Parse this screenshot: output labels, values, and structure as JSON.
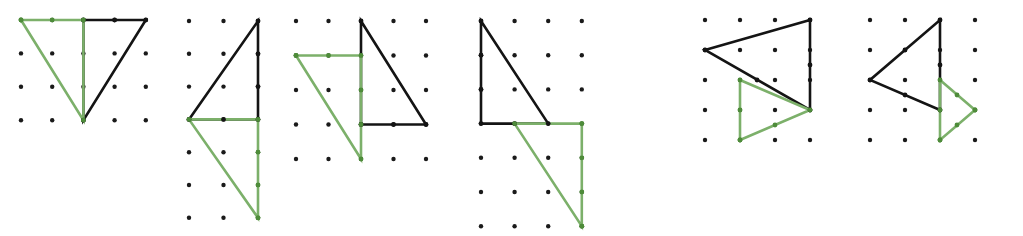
{
  "figure": {
    "width": 1023,
    "height": 236,
    "background_color": "#ffffff",
    "colors": {
      "black_shape": "#141414",
      "green_shape": "#7cb06a",
      "lattice_dot": "#1a1a1a",
      "vertex_dot_green": "#4e8c3a"
    },
    "stroke_width": 2.6,
    "dot_radius": 2.2,
    "vertex_dot_radius": 2.4
  },
  "panels": [
    {
      "id": "panel-1",
      "index": 1,
      "label": "",
      "lattice": {
        "columns": 5,
        "rows": 4,
        "origin_x": 21,
        "origin_y": 20,
        "step_x": 31.2,
        "step_y": 33.4,
        "dots": [
          [
            21,
            20
          ],
          [
            52.2,
            20
          ],
          [
            83.4,
            20
          ],
          [
            114.6,
            20
          ],
          [
            145.8,
            20
          ],
          [
            21,
            53.4
          ],
          [
            52.2,
            53.4
          ],
          [
            83.4,
            53.4
          ],
          [
            114.6,
            53.4
          ],
          [
            145.8,
            53.4
          ],
          [
            21,
            86.8
          ],
          [
            52.2,
            86.8
          ],
          [
            83.4,
            86.8
          ],
          [
            114.6,
            86.8
          ],
          [
            145.8,
            86.8
          ],
          [
            21,
            120.2
          ],
          [
            52.2,
            120.2
          ],
          [
            83.4,
            120.2
          ],
          [
            114.6,
            120.2
          ],
          [
            145.8,
            120.2
          ]
        ]
      },
      "shapes": [
        {
          "name": "black-triangle",
          "color": "black",
          "points": "83.4,20 145.8,20 83.4,120.2",
          "vertices": [
            [
              83.4,
              20
            ],
            [
              145.8,
              20
            ],
            [
              83.4,
              120.2
            ]
          ],
          "vertex_markers": [
            [
              114.6,
              20
            ]
          ]
        },
        {
          "name": "green-triangle",
          "color": "green",
          "points": "21,20 83.4,20 83.4,120.2",
          "vertices": [
            [
              21,
              20
            ],
            [
              83.4,
              20
            ],
            [
              83.4,
              120.2
            ]
          ],
          "vertex_markers": [
            [
              21,
              20
            ],
            [
              52.2,
              20
            ]
          ]
        }
      ]
    },
    {
      "id": "panel-2",
      "index": 2,
      "label": "",
      "lattice": {
        "columns": 3,
        "rows": 7,
        "origin_x": 189,
        "origin_y": 21,
        "step_x": 34.5,
        "step_y": 32.8,
        "dots": [
          [
            189,
            21
          ],
          [
            223.5,
            21
          ],
          [
            258,
            21
          ],
          [
            189,
            53.8
          ],
          [
            223.5,
            53.8
          ],
          [
            258,
            53.8
          ],
          [
            189,
            86.6
          ],
          [
            223.5,
            86.6
          ],
          [
            258,
            86.6
          ],
          [
            189,
            119.4
          ],
          [
            223.5,
            119.4
          ],
          [
            258,
            119.4
          ],
          [
            189,
            152.2
          ],
          [
            223.5,
            152.2
          ],
          [
            258,
            152.2
          ],
          [
            189,
            185
          ],
          [
            223.5,
            185
          ],
          [
            258,
            185
          ],
          [
            189,
            217.8
          ],
          [
            223.5,
            217.8
          ],
          [
            258,
            217.8
          ]
        ]
      },
      "shapes": [
        {
          "name": "black-triangle",
          "color": "black",
          "points": "258,21 258,119.4 189,119.4",
          "vertices": [
            [
              258,
              21
            ],
            [
              258,
              119.4
            ],
            [
              189,
              119.4
            ]
          ],
          "vertex_markers": [
            [
              258,
              53.8
            ],
            [
              258,
              86.6
            ],
            [
              223.5,
              119.4
            ]
          ]
        },
        {
          "name": "green-triangle",
          "color": "green",
          "points": "258,119.4 258,217.8 189,119.4",
          "vertices": [
            [
              258,
              119.4
            ],
            [
              258,
              217.8
            ],
            [
              189,
              119.4
            ]
          ],
          "vertex_markers": [
            [
              258,
              152.2
            ],
            [
              258,
              185
            ],
            [
              258,
              217.8
            ]
          ]
        }
      ]
    },
    {
      "id": "panel-3",
      "index": 3,
      "label": "",
      "lattice": {
        "columns": 5,
        "rows": 5,
        "origin_x": 296,
        "origin_y": 21,
        "step_x": 32.5,
        "step_y": 34.5,
        "dots": [
          [
            296,
            21
          ],
          [
            328.5,
            21
          ],
          [
            361,
            21
          ],
          [
            393.5,
            21
          ],
          [
            426,
            21
          ],
          [
            296,
            55.5
          ],
          [
            328.5,
            55.5
          ],
          [
            361,
            55.5
          ],
          [
            393.5,
            55.5
          ],
          [
            426,
            55.5
          ],
          [
            296,
            90
          ],
          [
            328.5,
            90
          ],
          [
            361,
            90
          ],
          [
            393.5,
            90
          ],
          [
            426,
            90
          ],
          [
            296,
            124.5
          ],
          [
            328.5,
            124.5
          ],
          [
            361,
            124.5
          ],
          [
            393.5,
            124.5
          ],
          [
            426,
            124.5
          ],
          [
            296,
            159
          ],
          [
            328.5,
            159
          ],
          [
            361,
            159
          ],
          [
            393.5,
            159
          ],
          [
            426,
            159
          ]
        ]
      },
      "shapes": [
        {
          "name": "black-triangle",
          "color": "black",
          "points": "361,21 426,124.5 361,124.5",
          "vertices": [
            [
              361,
              21
            ],
            [
              426,
              124.5
            ],
            [
              361,
              124.5
            ]
          ],
          "vertex_markers": [
            [
              393.5,
              124.5
            ]
          ]
        },
        {
          "name": "green-triangle",
          "color": "green",
          "points": "296,55.5 361,55.5 361,159",
          "vertices": [
            [
              296,
              55.5
            ],
            [
              361,
              55.5
            ],
            [
              361,
              159
            ]
          ],
          "vertex_markers": [
            [
              296,
              55.5
            ],
            [
              328.5,
              55.5
            ],
            [
              361,
              90
            ],
            [
              361,
              124.5
            ]
          ]
        }
      ]
    },
    {
      "id": "panel-4",
      "index": 4,
      "label": "",
      "lattice": {
        "columns": 4,
        "rows": 7,
        "origin_x": 481,
        "origin_y": 21,
        "step_x": 33.6,
        "step_y": 34.2,
        "dots": [
          [
            481,
            21
          ],
          [
            514.6,
            21
          ],
          [
            548.2,
            21
          ],
          [
            581.8,
            21
          ],
          [
            481,
            55.2
          ],
          [
            514.6,
            55.2
          ],
          [
            548.2,
            55.2
          ],
          [
            581.8,
            55.2
          ],
          [
            481,
            89.4
          ],
          [
            514.6,
            89.4
          ],
          [
            548.2,
            89.4
          ],
          [
            581.8,
            89.4
          ],
          [
            481,
            123.6
          ],
          [
            514.6,
            123.6
          ],
          [
            548.2,
            123.6
          ],
          [
            581.8,
            123.6
          ],
          [
            481,
            157.8
          ],
          [
            514.6,
            157.8
          ],
          [
            548.2,
            157.8
          ],
          [
            581.8,
            157.8
          ],
          [
            481,
            192
          ],
          [
            514.6,
            192
          ],
          [
            548.2,
            192
          ],
          [
            581.8,
            192
          ],
          [
            481,
            226.2
          ],
          [
            514.6,
            226.2
          ],
          [
            548.2,
            226.2
          ],
          [
            581.8,
            226.2
          ]
        ]
      },
      "shapes": [
        {
          "name": "black-triangle",
          "color": "black",
          "points": "481,21 548.2,123.6 481,123.6",
          "vertices": [
            [
              481,
              21
            ],
            [
              548.2,
              123.6
            ],
            [
              481,
              123.6
            ]
          ],
          "vertex_markers": [
            [
              481,
              55.2
            ],
            [
              481,
              89.4
            ],
            [
              514.6,
              123.6
            ]
          ]
        },
        {
          "name": "green-triangle",
          "color": "green",
          "points": "514.6,123.6 581.8,123.6 581.8,226.2",
          "vertices": [
            [
              514.6,
              123.6
            ],
            [
              581.8,
              123.6
            ],
            [
              581.8,
              226.2
            ]
          ],
          "vertex_markers": [
            [
              581.8,
              123.6
            ],
            [
              581.8,
              157.8
            ],
            [
              581.8,
              192
            ],
            [
              581.8,
              226.2
            ]
          ]
        }
      ]
    },
    {
      "id": "panel-5",
      "index": 5,
      "label": "",
      "lattice": {
        "columns": 4,
        "rows": 5,
        "origin_x": 705,
        "origin_y": 20,
        "step_x": 35,
        "step_y": 30,
        "dots": [
          [
            705,
            20
          ],
          [
            740,
            20
          ],
          [
            775,
            20
          ],
          [
            810,
            20
          ],
          [
            705,
            50
          ],
          [
            740,
            50
          ],
          [
            775,
            50
          ],
          [
            810,
            50
          ],
          [
            705,
            80
          ],
          [
            740,
            80
          ],
          [
            775,
            80
          ],
          [
            810,
            80
          ],
          [
            705,
            110
          ],
          [
            740,
            110
          ],
          [
            775,
            110
          ],
          [
            810,
            110
          ],
          [
            705,
            140
          ],
          [
            740,
            140
          ],
          [
            775,
            140
          ],
          [
            810,
            140
          ]
        ]
      },
      "shapes": [
        {
          "name": "black-triangle",
          "color": "black",
          "points": "705,50 810,20 810,110",
          "vertices": [
            [
              705,
              50
            ],
            [
              810,
              20
            ],
            [
              810,
              110
            ]
          ],
          "vertex_markers": [
            [
              810,
              65
            ],
            [
              757,
              80
            ]
          ]
        },
        {
          "name": "green-triangle",
          "color": "green",
          "points": "740,80 810,110 740,140",
          "vertices": [
            [
              740,
              80
            ],
            [
              810,
              110
            ],
            [
              740,
              140
            ]
          ],
          "vertex_markers": [
            [
              740,
              110
            ],
            [
              775,
              125
            ],
            [
              740,
              140
            ]
          ]
        }
      ]
    },
    {
      "id": "panel-6",
      "index": 6,
      "label": "",
      "lattice": {
        "columns": 4,
        "rows": 5,
        "origin_x": 870,
        "origin_y": 20,
        "step_x": 35,
        "step_y": 30,
        "dots": [
          [
            870,
            20
          ],
          [
            905,
            20
          ],
          [
            940,
            20
          ],
          [
            975,
            20
          ],
          [
            870,
            50
          ],
          [
            905,
            50
          ],
          [
            940,
            50
          ],
          [
            975,
            50
          ],
          [
            870,
            80
          ],
          [
            905,
            80
          ],
          [
            940,
            80
          ],
          [
            975,
            80
          ],
          [
            870,
            110
          ],
          [
            905,
            110
          ],
          [
            940,
            110
          ],
          [
            975,
            110
          ],
          [
            870,
            140
          ],
          [
            905,
            140
          ],
          [
            940,
            140
          ],
          [
            975,
            140
          ]
        ]
      },
      "shapes": [
        {
          "name": "black-triangle",
          "color": "black",
          "points": "940,20 940,110 870,80",
          "vertices": [
            [
              940,
              20
            ],
            [
              940,
              110
            ],
            [
              870,
              80
            ]
          ],
          "vertex_markers": [
            [
              905,
              50
            ],
            [
              905,
              95
            ],
            [
              940,
              65
            ]
          ]
        },
        {
          "name": "green-triangle",
          "color": "green",
          "points": "940,80 975,110 940,140",
          "vertices": [
            [
              940,
              80
            ],
            [
              975,
              110
            ],
            [
              940,
              140
            ]
          ],
          "vertex_markers": [
            [
              940,
              110
            ],
            [
              957,
              95
            ],
            [
              957,
              125
            ],
            [
              940,
              140
            ],
            [
              975,
              110
            ]
          ]
        }
      ]
    }
  ]
}
